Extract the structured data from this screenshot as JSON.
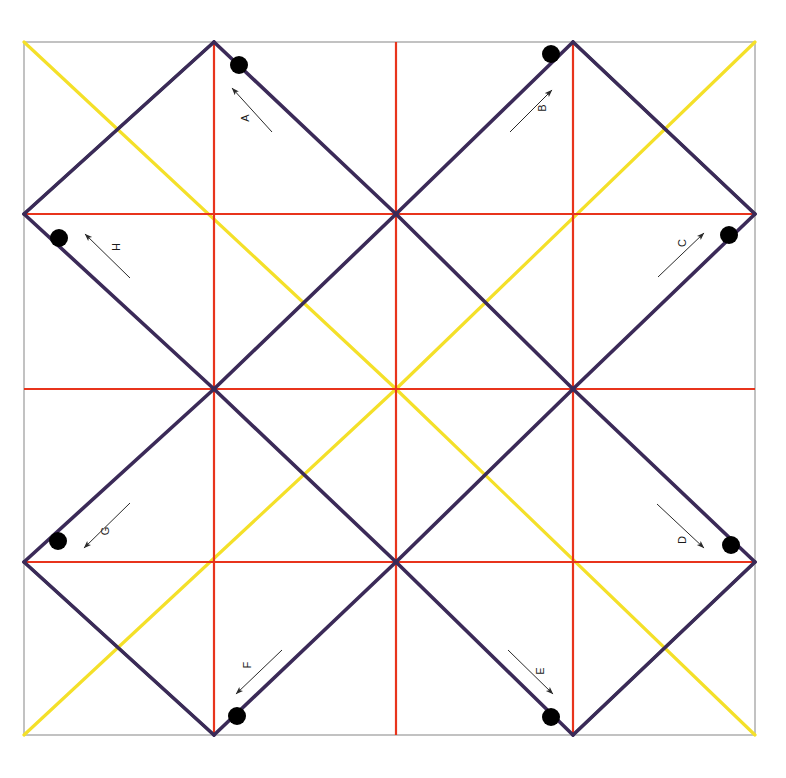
{
  "canvas": {
    "width": 786,
    "height": 778,
    "background": "#ffffff",
    "title": "Square lattice diagram with labelled directed vectors"
  },
  "frame": {
    "left": 24,
    "top": 42,
    "right": 755,
    "bottom": 735,
    "stroke": "#9a9a9a",
    "stroke_width": 1.2
  },
  "grid": {
    "x_positions": [
      24,
      214,
      396,
      573,
      755
    ],
    "y_positions": [
      42,
      214,
      389,
      562,
      735
    ],
    "interior_x": [
      214,
      396,
      573
    ],
    "interior_y": [
      214,
      389,
      562
    ],
    "color": "#e8341c",
    "stroke_width": 2.2
  },
  "colors": {
    "red": "#e8341c",
    "purple": "#3b2a58",
    "green": "#217a3d",
    "yellow": "#f4e029",
    "dot": "#000000",
    "arrow": "#2a2a2a",
    "border": "#9a9a9a"
  },
  "purple_lines": [
    {
      "name": "purple-nw-long-a",
      "x1": 214,
      "y1": 42,
      "x2": 24,
      "y2": 214
    },
    {
      "name": "purple-nw-long-b",
      "x1": 214,
      "y1": 42,
      "x2": 396,
      "y2": 214
    },
    {
      "name": "purple-ne-long-a",
      "x1": 573,
      "y1": 42,
      "x2": 396,
      "y2": 214
    },
    {
      "name": "purple-ne-long-b",
      "x1": 573,
      "y1": 42,
      "x2": 755,
      "y2": 214
    },
    {
      "name": "purple-w-upper",
      "x1": 24,
      "y1": 214,
      "x2": 214,
      "y2": 389
    },
    {
      "name": "purple-c-left-up",
      "x1": 396,
      "y1": 214,
      "x2": 214,
      "y2": 389
    },
    {
      "name": "purple-c-right-up",
      "x1": 396,
      "y1": 214,
      "x2": 573,
      "y2": 389
    },
    {
      "name": "purple-e-upper",
      "x1": 755,
      "y1": 214,
      "x2": 573,
      "y2": 389
    },
    {
      "name": "purple-w-lower",
      "x1": 214,
      "y1": 389,
      "x2": 24,
      "y2": 562
    },
    {
      "name": "purple-c-left-dn",
      "x1": 214,
      "y1": 389,
      "x2": 396,
      "y2": 562
    },
    {
      "name": "purple-c-right-dn",
      "x1": 573,
      "y1": 389,
      "x2": 396,
      "y2": 562
    },
    {
      "name": "purple-e-lower",
      "x1": 573,
      "y1": 389,
      "x2": 755,
      "y2": 562
    },
    {
      "name": "purple-sw-long-a",
      "x1": 24,
      "y1": 562,
      "x2": 214,
      "y2": 735
    },
    {
      "name": "purple-sw-long-b",
      "x1": 396,
      "y1": 562,
      "x2": 214,
      "y2": 735
    },
    {
      "name": "purple-se-long-a",
      "x1": 396,
      "y1": 562,
      "x2": 573,
      "y2": 735
    },
    {
      "name": "purple-se-long-b",
      "x1": 755,
      "y1": 562,
      "x2": 573,
      "y2": 735
    }
  ],
  "green_lines": [
    {
      "name": "green-top-left",
      "x1": 24,
      "y1": 214,
      "x2": 214,
      "y2": 42
    },
    {
      "name": "green-top-right",
      "x1": 573,
      "y1": 42,
      "x2": 755,
      "y2": 214
    },
    {
      "name": "green-bottom-left",
      "x1": 24,
      "y1": 562,
      "x2": 214,
      "y2": 735
    },
    {
      "name": "green-bottom-right",
      "x1": 573,
      "y1": 735,
      "x2": 755,
      "y2": 562
    }
  ],
  "yellow_lines": [
    {
      "name": "yellow-nw-diagonal",
      "x1": 24,
      "y1": 42,
      "x2": 396,
      "y2": 389
    },
    {
      "name": "yellow-ne-diagonal",
      "x1": 755,
      "y1": 42,
      "x2": 396,
      "y2": 389
    },
    {
      "name": "yellow-sw-diagonal",
      "x1": 24,
      "y1": 735,
      "x2": 396,
      "y2": 389
    },
    {
      "name": "yellow-se-diagonal",
      "x1": 755,
      "y1": 735,
      "x2": 396,
      "y2": 389
    }
  ],
  "dots": [
    {
      "name": "dot-a",
      "cx": 239,
      "cy": 65,
      "r": 9
    },
    {
      "name": "dot-b",
      "cx": 551,
      "cy": 54,
      "r": 9
    },
    {
      "name": "dot-c",
      "cx": 729,
      "cy": 235,
      "r": 9
    },
    {
      "name": "dot-d",
      "cx": 731,
      "cy": 545,
      "r": 9
    },
    {
      "name": "dot-e",
      "cx": 551,
      "cy": 717,
      "r": 9
    },
    {
      "name": "dot-f",
      "cx": 237,
      "cy": 716,
      "r": 9
    },
    {
      "name": "dot-g",
      "cx": 58,
      "cy": 541,
      "r": 9
    },
    {
      "name": "dot-h",
      "cx": 59,
      "cy": 238,
      "r": 9
    }
  ],
  "vectors": [
    {
      "id": "A",
      "label": "A",
      "tail_x": 272,
      "tail_y": 132,
      "head_x": 232,
      "head_y": 88,
      "label_x": 246,
      "label_y": 118,
      "label_rotation": -90,
      "description": "arrow pointing up-left toward top vertex"
    },
    {
      "id": "B",
      "label": "B",
      "tail_x": 510,
      "tail_y": 132,
      "head_x": 552,
      "head_y": 90,
      "label_x": 543,
      "label_y": 108,
      "label_rotation": -90,
      "description": "arrow pointing up-right toward top vertex"
    },
    {
      "id": "C",
      "label": "C",
      "tail_x": 658,
      "tail_y": 277,
      "head_x": 704,
      "head_y": 233,
      "label_x": 683,
      "label_y": 243,
      "label_rotation": -90,
      "description": "arrow pointing up-right toward right vertex"
    },
    {
      "id": "D",
      "label": "D",
      "tail_x": 657,
      "tail_y": 504,
      "head_x": 704,
      "head_y": 548,
      "label_x": 683,
      "label_y": 540,
      "label_rotation": -90,
      "description": "arrow pointing down-right toward right vertex"
    },
    {
      "id": "E",
      "label": "E",
      "tail_x": 508,
      "tail_y": 650,
      "head_x": 553,
      "head_y": 694,
      "label_x": 541,
      "label_y": 671,
      "label_rotation": -90,
      "description": "arrow pointing down-right toward bottom vertex"
    },
    {
      "id": "F",
      "label": "F",
      "tail_x": 282,
      "tail_y": 650,
      "head_x": 236,
      "head_y": 694,
      "label_x": 248,
      "label_y": 665,
      "label_rotation": -90,
      "description": "arrow pointing down-left toward bottom vertex"
    },
    {
      "id": "G",
      "label": "G",
      "tail_x": 130,
      "tail_y": 503,
      "head_x": 84,
      "head_y": 548,
      "label_x": 106,
      "label_y": 531,
      "label_rotation": -90,
      "description": "arrow pointing down-left toward left vertex"
    },
    {
      "id": "H",
      "label": "H",
      "tail_x": 130,
      "tail_y": 278,
      "head_x": 85,
      "head_y": 234,
      "label_x": 117,
      "label_y": 247,
      "label_rotation": -90,
      "description": "arrow pointing up-left toward left vertex"
    }
  ]
}
